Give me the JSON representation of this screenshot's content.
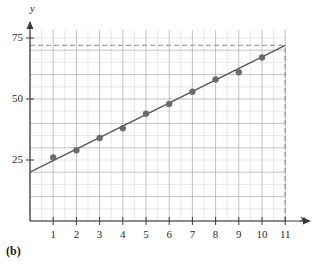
{
  "panel": {
    "label": "(b)"
  },
  "axes": {
    "x_name": "x",
    "y_name": "y"
  },
  "chart_data": {
    "type": "scatter",
    "title": "",
    "subtitle": "",
    "xlabel": "x",
    "ylabel": "y",
    "x": [
      1,
      2,
      3,
      4,
      5,
      6,
      7,
      8,
      9,
      10
    ],
    "values": [
      26,
      29,
      34,
      38,
      44,
      48,
      53,
      58,
      61,
      67
    ],
    "series": [
      {
        "name": "data points",
        "marker": "filled-circle",
        "color": "#6b6b6b",
        "x": [
          1,
          2,
          3,
          4,
          5,
          6,
          7,
          8,
          9,
          10
        ],
        "values": [
          26,
          29,
          34,
          38,
          44,
          48,
          53,
          58,
          61,
          67
        ]
      },
      {
        "name": "regression line",
        "type": "line",
        "color": "#595959",
        "x": [
          0,
          11
        ],
        "values": [
          20,
          72
        ]
      }
    ],
    "xlim": [
      0,
      11
    ],
    "ylim": [
      0,
      80
    ],
    "xticks": [
      1,
      2,
      3,
      4,
      5,
      6,
      7,
      8,
      9,
      10,
      11
    ],
    "xtick_labels": [
      "1",
      "2",
      "3",
      "4",
      "5",
      "6",
      "7",
      "8",
      "9",
      "10",
      "11"
    ],
    "yticks": [
      25,
      50,
      75
    ],
    "ytick_labels": [
      "25",
      "50",
      "75"
    ],
    "grid": true,
    "grid_x_step": 0.5,
    "grid_y_step": 5,
    "legend": "none",
    "annotations": [
      {
        "name": "horizontal-dashed-guide",
        "type": "dashed-horizontal",
        "y": 72,
        "x_from": 0,
        "x_to": 11
      },
      {
        "name": "vertical-dashed-guide",
        "type": "dashed-vertical",
        "x": 11,
        "y_from": 0,
        "y_to": 72
      }
    ]
  }
}
